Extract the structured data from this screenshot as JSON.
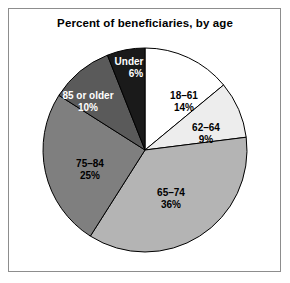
{
  "chart_data": {
    "type": "pie",
    "title": "Percent of beneficiaries, by age",
    "xlabel": "",
    "ylabel": "",
    "legend": "none",
    "grid": false,
    "start_angle_deg": 0,
    "direction": "clockwise",
    "categories": [
      "18–61",
      "62–64",
      "65–74",
      "75–84",
      "85 or older",
      "Under 18"
    ],
    "values": [
      14,
      9,
      36,
      25,
      10,
      6
    ],
    "unit": "percent",
    "total": 100,
    "slices": [
      {
        "label": "18–61",
        "value": 14,
        "value_text": "14%",
        "color": "#ffffff",
        "text_color": "#000000",
        "label_x": 184,
        "label_y": 90
      },
      {
        "label": "62–64",
        "value": 9,
        "value_text": "9%",
        "color": "#ededed",
        "text_color": "#000000",
        "label_x": 206,
        "label_y": 122
      },
      {
        "label": "65–74",
        "value": 36,
        "value_text": "36%",
        "color": "#b4b4b4",
        "text_color": "#000000",
        "label_x": 171,
        "label_y": 187
      },
      {
        "label": "75–84",
        "value": 25,
        "value_text": "25%",
        "color": "#7f7f7f",
        "text_color": "#000000",
        "label_x": 90,
        "label_y": 158
      },
      {
        "label": "85 or older",
        "value": 10,
        "value_text": "10%",
        "color": "#5a5a5a",
        "text_color": "#ffffff",
        "label_x": 88,
        "label_y": 90
      },
      {
        "label": "Under 18",
        "value": 6,
        "value_text": "6%",
        "color": "#1a1a1a",
        "text_color": "#ffffff",
        "label_x": 136,
        "label_y": 56
      }
    ],
    "geometry": {
      "center_x": 145,
      "center_y": 150,
      "radius": 102
    },
    "style": {
      "outline_color": "#000000",
      "frame_color": "#8d8d8d",
      "background": "#ffffff"
    }
  }
}
